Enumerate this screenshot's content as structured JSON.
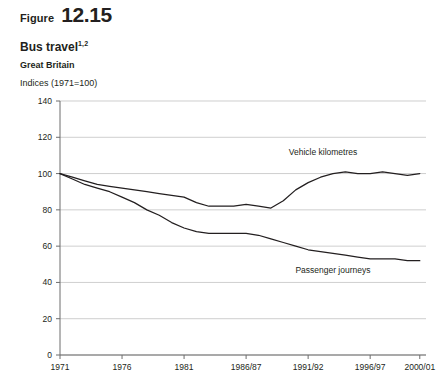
{
  "figure": {
    "label": "Figure",
    "number": "12.15"
  },
  "chart_data": {
    "type": "line",
    "title": "Bus travel",
    "title_superscript": "1,2",
    "subtitle": "Great Britain",
    "units": "Indices (1971=100)",
    "xlabel": "",
    "ylabel": "",
    "grid": true,
    "legend_position": "inline-annotation",
    "ylim": [
      0,
      140
    ],
    "yticks": [
      0,
      20,
      40,
      60,
      80,
      100,
      120,
      140
    ],
    "ytick_labels": [
      "0",
      "20",
      "40",
      "60",
      "80",
      "100",
      "120",
      "140"
    ],
    "xlim": [
      1971,
      2000.5
    ],
    "xticks": [
      1971,
      1976,
      1981,
      1986,
      1991,
      1996,
      2000
    ],
    "xtick_labels": [
      "1971",
      "1976",
      "1981",
      "1986/87",
      "1991/92",
      "1996/97",
      "2000/01"
    ],
    "x": [
      1971,
      1972,
      1973,
      1974,
      1975,
      1976,
      1977,
      1978,
      1979,
      1980,
      1981,
      1982,
      1983,
      1984,
      1985,
      1986,
      1987,
      1988,
      1989,
      1990,
      1991,
      1992,
      1993,
      1994,
      1995,
      1996,
      1997,
      1998,
      1999,
      2000
    ],
    "series": [
      {
        "name": "Vehicle kilometres",
        "label": "Vehicle kilometres",
        "color": "#231f20",
        "values": [
          100,
          98,
          96,
          94,
          93,
          92,
          91,
          90,
          89,
          88,
          87,
          84,
          82,
          82,
          82,
          83,
          82,
          81,
          85,
          91,
          95,
          98,
          100,
          101,
          100,
          100,
          101,
          100,
          99,
          100
        ]
      },
      {
        "name": "Passenger journeys",
        "label": "Passenger journeys",
        "color": "#231f20",
        "values": [
          100,
          97,
          94,
          92,
          90,
          87,
          84,
          80,
          77,
          73,
          70,
          68,
          67,
          67,
          67,
          67,
          66,
          64,
          62,
          60,
          58,
          57,
          56,
          55,
          54,
          53,
          53,
          53,
          52,
          52
        ]
      }
    ],
    "annotations": [
      {
        "text": "Vehicle kilometres",
        "x": 1992.2,
        "y": 110
      },
      {
        "text": "Passenger journeys",
        "x": 1993.0,
        "y": 45
      }
    ]
  }
}
